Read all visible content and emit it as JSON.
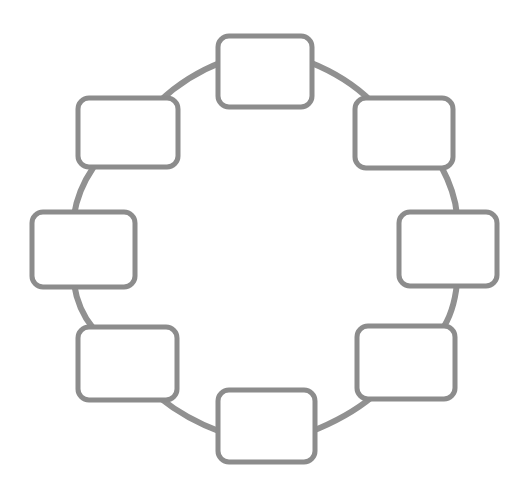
{
  "diagram": {
    "title": "",
    "type": "cycle-diagram",
    "shape": "ring",
    "node_count": 8,
    "connector_count": 8,
    "colors": {
      "background": "#ffffff",
      "node_stroke": "#8c8c8c",
      "node_fill": "#ffffff",
      "connector_stroke": "#919191",
      "label_text": "#4a4a4a"
    },
    "geometry": {
      "canvas_width": 531,
      "canvas_height": 489,
      "ring_center_x": 265,
      "ring_center_y": 244,
      "ring_radius_x": 168,
      "ring_radius_y": 176,
      "node_stroke_width": 5,
      "connector_stroke_width": 6,
      "node_corner_radius": 11
    },
    "nodes": [
      {
        "id": "node-top",
        "position": "top",
        "label": "",
        "x": 218,
        "y": 36,
        "width": 94,
        "height": 71
      },
      {
        "id": "node-top-right",
        "position": "top-right",
        "label": "",
        "x": 355,
        "y": 98,
        "width": 98,
        "height": 70
      },
      {
        "id": "node-right",
        "position": "right",
        "label": "",
        "x": 399,
        "y": 212,
        "width": 98,
        "height": 74
      },
      {
        "id": "node-bottom-right",
        "position": "bottom-right",
        "label": "",
        "x": 357,
        "y": 326,
        "width": 98,
        "height": 73
      },
      {
        "id": "node-bottom",
        "position": "bottom",
        "label": "",
        "x": 218,
        "y": 390,
        "width": 97,
        "height": 72
      },
      {
        "id": "node-bottom-left",
        "position": "bottom-left",
        "label": "",
        "x": 78,
        "y": 327,
        "width": 99,
        "height": 73
      },
      {
        "id": "node-left",
        "position": "left",
        "label": "",
        "x": 32,
        "y": 212,
        "width": 103,
        "height": 75
      },
      {
        "id": "node-top-left",
        "position": "top-left",
        "label": "",
        "x": 78,
        "y": 98,
        "width": 100,
        "height": 69
      }
    ],
    "connectors": [
      {
        "id": "connector-top-left-to-top",
        "from": "node-top-left",
        "to": "node-top"
      },
      {
        "id": "connector-top-to-top-right",
        "from": "node-top",
        "to": "node-top-right"
      },
      {
        "id": "connector-top-right-to-right",
        "from": "node-top-right",
        "to": "node-right"
      },
      {
        "id": "connector-right-to-bottom-right",
        "from": "node-right",
        "to": "node-bottom-right"
      },
      {
        "id": "connector-bottom-right-to-bottom",
        "from": "node-bottom-right",
        "to": "node-bottom"
      },
      {
        "id": "connector-bottom-to-bottom-left",
        "from": "node-bottom",
        "to": "node-bottom-left"
      },
      {
        "id": "connector-bottom-left-to-left",
        "from": "node-bottom-left",
        "to": "node-left"
      },
      {
        "id": "connector-left-to-top-left",
        "from": "node-left",
        "to": "node-top-left"
      }
    ]
  }
}
